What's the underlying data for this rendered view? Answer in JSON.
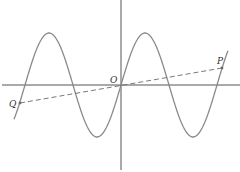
{
  "diagram": {
    "type": "function-graph",
    "labels": {
      "origin": "O",
      "point_p": "P",
      "point_q": "Q"
    },
    "colors": {
      "axis": "#555555",
      "curve": "#8a8a8a",
      "dashed_line": "#6a6a6a",
      "text": "#333333"
    },
    "geometry": {
      "origin_px": [
        121,
        85
      ],
      "period_px": 96,
      "amplitude_px": 52,
      "curve_x_range_px": [
        14,
        228
      ],
      "point_p_px": [
        222,
        68
      ],
      "point_q_px": [
        20,
        103
      ]
    }
  }
}
